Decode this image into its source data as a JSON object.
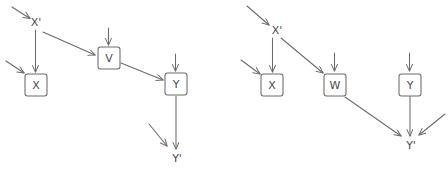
{
  "figure": {
    "background_color": "#ffffff",
    "stroke_color": "#666666",
    "label_color": "#4a4a4a",
    "panel_count": 2
  },
  "panels": [
    {
      "id": "left-panel",
      "name": "left-causal-diagram",
      "nodes": [
        {
          "id": "xprime",
          "label": "X'",
          "boxed": false,
          "cx": 36,
          "cy": 22,
          "font_size": 11
        },
        {
          "id": "x",
          "label": "X",
          "boxed": true,
          "cx": 36,
          "cy": 85,
          "w": 22,
          "h": 22,
          "font_size": 11
        },
        {
          "id": "v",
          "label": "V",
          "boxed": true,
          "cx": 109,
          "cy": 58,
          "w": 22,
          "h": 22,
          "font_size": 11
        },
        {
          "id": "y",
          "label": "Y",
          "boxed": true,
          "cx": 176,
          "cy": 84,
          "w": 22,
          "h": 22,
          "font_size": 11
        },
        {
          "id": "yprime",
          "label": "Y'",
          "boxed": false,
          "cx": 177,
          "cy": 158,
          "font_size": 11
        }
      ],
      "edges": [
        {
          "from": "xprime",
          "to": "x",
          "kind": "structural"
        },
        {
          "from": "xprime",
          "to": "v",
          "kind": "structural"
        },
        {
          "from": "v",
          "to": "y",
          "kind": "structural"
        },
        {
          "from": "y",
          "to": "yprime",
          "kind": "structural"
        }
      ],
      "exogenous_arrows": [
        {
          "target": "xprime",
          "direction": "from-upper-left"
        },
        {
          "target": "x",
          "direction": "from-upper-left"
        },
        {
          "target": "x",
          "direction": "from-above"
        },
        {
          "target": "v",
          "direction": "from-above"
        },
        {
          "target": "y",
          "direction": "from-above"
        },
        {
          "target": "yprime",
          "direction": "from-upper-left"
        }
      ]
    },
    {
      "id": "right-panel",
      "name": "right-causal-diagram",
      "nodes": [
        {
          "id": "xprime2",
          "label": "X'",
          "boxed": false,
          "cx": 277,
          "cy": 30,
          "font_size": 11
        },
        {
          "id": "x2",
          "label": "X",
          "boxed": true,
          "cx": 272,
          "cy": 85,
          "w": 22,
          "h": 22,
          "font_size": 11
        },
        {
          "id": "w2",
          "label": "W",
          "boxed": true,
          "cx": 335,
          "cy": 85,
          "w": 22,
          "h": 22,
          "font_size": 11
        },
        {
          "id": "y2",
          "label": "Y",
          "boxed": true,
          "cx": 410,
          "cy": 85,
          "w": 22,
          "h": 22,
          "font_size": 11
        },
        {
          "id": "yprime2",
          "label": "Y'",
          "boxed": false,
          "cx": 411,
          "cy": 145,
          "font_size": 11
        }
      ],
      "edges": [
        {
          "from": "xprime2",
          "to": "x2",
          "kind": "structural"
        },
        {
          "from": "xprime2",
          "to": "w2",
          "kind": "structural"
        },
        {
          "from": "w2",
          "to": "yprime2",
          "kind": "structural"
        },
        {
          "from": "y2",
          "to": "yprime2",
          "kind": "structural"
        }
      ],
      "exogenous_arrows": [
        {
          "target": "xprime2",
          "direction": "from-upper-left"
        },
        {
          "target": "x2",
          "direction": "from-upper-left"
        },
        {
          "target": "x2",
          "direction": "from-above"
        },
        {
          "target": "w2",
          "direction": "from-above"
        },
        {
          "target": "y2",
          "direction": "from-above"
        },
        {
          "target": "yprime2",
          "direction": "from-upper-right"
        }
      ]
    }
  ]
}
